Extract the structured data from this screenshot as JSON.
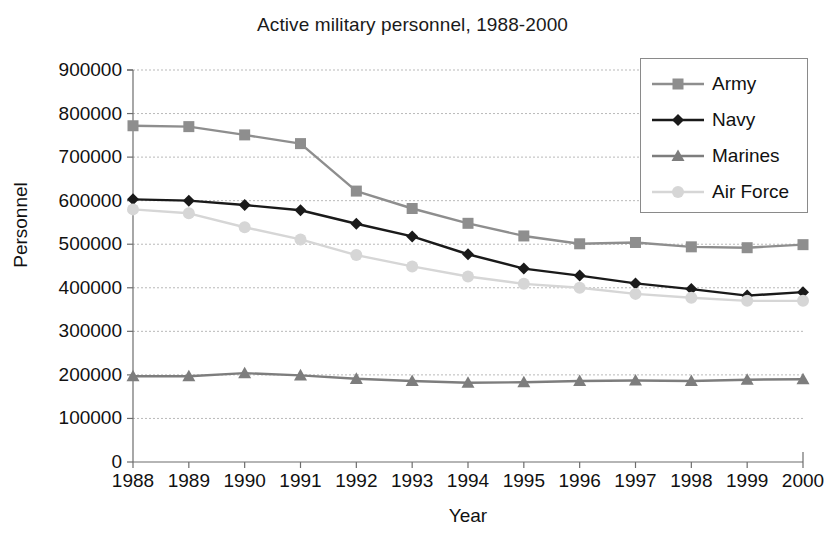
{
  "chart_data": {
    "type": "line",
    "title": "Active military personnel, 1988-2000",
    "xlabel": "Year",
    "ylabel": "Personnel",
    "x": [
      1988,
      1989,
      1990,
      1991,
      1992,
      1993,
      1994,
      1995,
      1996,
      1997,
      1998,
      1999,
      2000
    ],
    "categories": [
      "1988",
      "1989",
      "1990",
      "1991",
      "1992",
      "1993",
      "1994",
      "1995",
      "1996",
      "1997",
      "1998",
      "1999",
      "2000"
    ],
    "ylim": [
      0,
      900000
    ],
    "yticks": [
      0,
      100000,
      200000,
      300000,
      400000,
      500000,
      600000,
      700000,
      800000,
      900000
    ],
    "ytick_labels": [
      "0",
      "100000",
      "200000",
      "300000",
      "400000",
      "500000",
      "600000",
      "700000",
      "800000",
      "900000"
    ],
    "grid": true,
    "legend_position": "top-right",
    "series": [
      {
        "name": "Army",
        "color": "#8e8e8e",
        "marker": "square",
        "values": [
          772000,
          770000,
          751000,
          731000,
          622000,
          582000,
          548000,
          519000,
          501000,
          504000,
          494000,
          492000,
          499000
        ]
      },
      {
        "name": "Navy",
        "color": "#1a1a1a",
        "marker": "diamond",
        "values": [
          603000,
          600000,
          590000,
          578000,
          547000,
          518000,
          477000,
          444000,
          428000,
          410000,
          397000,
          382000,
          390000
        ]
      },
      {
        "name": "Marines",
        "color": "#7d7d7d",
        "marker": "triangle",
        "values": [
          197000,
          197000,
          204000,
          199000,
          191000,
          186000,
          182000,
          183000,
          186000,
          187000,
          186000,
          189000,
          190000
        ]
      },
      {
        "name": "Air Force",
        "color": "#d6d6d6",
        "marker": "circle",
        "values": [
          580000,
          571000,
          539000,
          511000,
          475000,
          449000,
          426000,
          409000,
          400000,
          386000,
          377000,
          370000,
          370000
        ]
      }
    ]
  }
}
